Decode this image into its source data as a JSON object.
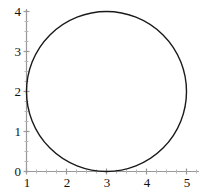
{
  "figure": {
    "name": "circle-plot",
    "background_color": "#ffffff",
    "axis_color": "#9a9a9a",
    "curve_color": "#1a1a1a",
    "label_color": "#111111"
  },
  "axes": {
    "x": {
      "tick_labels": [
        "1",
        "2",
        "3",
        "4",
        "5"
      ],
      "ticks": [
        1,
        2,
        3,
        4,
        5
      ],
      "range": [
        1,
        5
      ],
      "minor_ticks_per_interval": 4
    },
    "y": {
      "tick_labels": [
        "0",
        "1",
        "2",
        "3",
        "4"
      ],
      "ticks": [
        0,
        1,
        2,
        3,
        4
      ],
      "range": [
        0,
        4
      ],
      "minor_ticks_per_interval": 4
    }
  },
  "chart_data": {
    "type": "line",
    "title": "",
    "subtitle": "",
    "xlabel": "",
    "ylabel": "",
    "xlim": [
      1,
      5
    ],
    "ylim": [
      0,
      4
    ],
    "grid": false,
    "legend": null,
    "xticks": [
      1,
      2,
      3,
      4,
      5
    ],
    "yticks": [
      0,
      1,
      2,
      3,
      4
    ],
    "xticklabels": [
      "1",
      "2",
      "3",
      "4",
      "5"
    ],
    "yticklabels": [
      "0",
      "1",
      "2",
      "3",
      "4"
    ],
    "series": [
      {
        "name": "circle",
        "shape": "circle",
        "center": [
          3,
          2
        ],
        "radius": 2,
        "equation": "(x - 3)^2 + (y - 2)^2 = 4",
        "color": "#1a1a1a",
        "linewidth": 1.4,
        "closed": true,
        "extreme_points": {
          "leftmost": [
            1,
            2
          ],
          "rightmost": [
            5,
            2
          ],
          "topmost": [
            3,
            4
          ],
          "bottommost": [
            3,
            0
          ]
        }
      }
    ],
    "annotations": []
  }
}
